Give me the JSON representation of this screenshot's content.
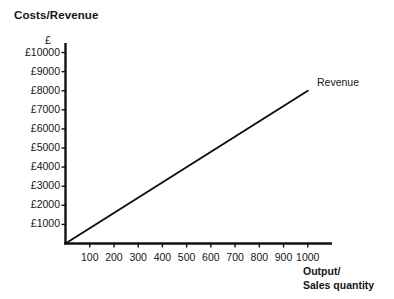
{
  "chart_data": {
    "type": "line",
    "title": "Costs/Revenue",
    "xlabel_lines": [
      "Output/",
      "Sales quantity"
    ],
    "ylabel": "£",
    "xlim": [
      0,
      1100
    ],
    "ylim": [
      0,
      10500
    ],
    "grid": false,
    "legend_position": "inline-end-of-line",
    "x_ticks": [
      100,
      200,
      300,
      400,
      500,
      600,
      700,
      800,
      900,
      1000
    ],
    "x_tick_labels": [
      "100",
      "200",
      "300",
      "400",
      "500",
      "600",
      "700",
      "800",
      "900",
      "1000"
    ],
    "y_ticks": [
      1000,
      2000,
      3000,
      4000,
      5000,
      6000,
      7000,
      8000,
      9000,
      10000
    ],
    "y_tick_labels": [
      "£1000",
      "£2000",
      "£3000",
      "£4000",
      "£5000",
      "£6000",
      "£7000",
      "£8000",
      "£9000",
      "£10000"
    ],
    "series": [
      {
        "name": "Revenue",
        "color": "#111111",
        "points": [
          [
            0,
            0
          ],
          [
            1000,
            8000
          ]
        ]
      }
    ],
    "annotations": [
      {
        "text": "Revenue",
        "x": 1040,
        "y": 8250
      }
    ]
  },
  "axis_color": "#111111",
  "line_color": "#111111"
}
